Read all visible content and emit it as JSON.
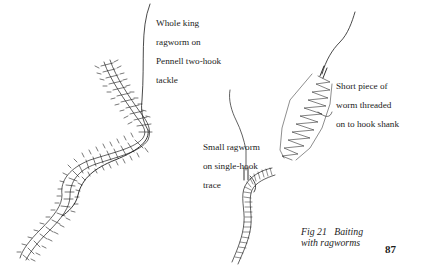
{
  "figure": {
    "number_label": "Fig 21",
    "title": "Baiting with ragworms",
    "caption_lines": [
      "Fig 21   Baiting",
      "with ragworms"
    ]
  },
  "labels": {
    "whole_king": {
      "lines": [
        "Whole king",
        "ragworm on",
        "Pennell two-hook",
        "tackle"
      ]
    },
    "short_piece": {
      "lines": [
        "Short piece of",
        "worm threaded",
        "on to hook shank"
      ]
    },
    "small_ragworm": {
      "lines": [
        "Small ragworm",
        "on single-hook",
        "trace"
      ]
    }
  },
  "page": {
    "number": "87"
  },
  "colors": {
    "ink": "#1c1c1c",
    "paper": "#ffffff"
  }
}
